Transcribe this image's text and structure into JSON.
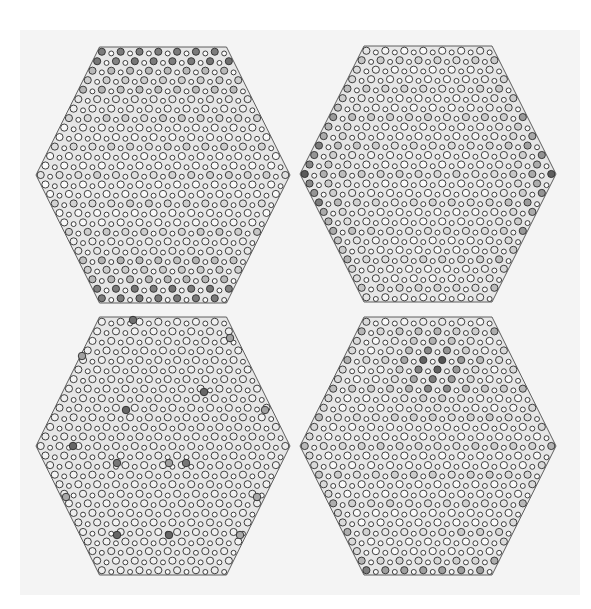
{
  "figure": {
    "background": "#f4f4f4",
    "site_outline": "#2a2a2a",
    "bond_color": "#3a3a3a",
    "white_site": "#fbfbfb",
    "dark_site": "#555555",
    "layout": {
      "rows": 2,
      "cols": 2
    }
  },
  "panels": [
    {
      "id": "top-left",
      "center": [
        163,
        175
      ],
      "half_width": 127,
      "half_height": 128,
      "pattern": "edge-top-bottom",
      "description": "Weight concentrated on top and bottom zigzag edges with faint horizontal stripes"
    },
    {
      "id": "top-right",
      "center": [
        428,
        174
      ],
      "half_width": 128,
      "half_height": 128,
      "pattern": "edge-left-right",
      "description": "Weight concentrated at left and right vertices along the central rows"
    },
    {
      "id": "bottom-left",
      "center": [
        163,
        446
      ],
      "half_width": 127,
      "half_height": 129,
      "pattern": "sparse-defects",
      "description": "Nearly uniform light sites with scattered dark isolated sites",
      "dark_sites": [
        [
          133,
          320,
          0.85
        ],
        [
          230,
          338,
          0.55
        ],
        [
          82,
          356,
          0.55
        ],
        [
          204,
          392,
          0.9
        ],
        [
          126,
          410,
          0.9
        ],
        [
          265,
          410,
          0.55
        ],
        [
          73,
          446,
          0.9
        ],
        [
          117,
          463,
          0.8
        ],
        [
          169,
          463,
          0.55
        ],
        [
          186,
          463,
          0.8
        ],
        [
          66,
          497,
          0.5
        ],
        [
          257,
          497,
          0.5
        ],
        [
          117,
          535,
          0.9
        ],
        [
          169,
          535,
          0.9
        ],
        [
          240,
          535,
          0.5
        ]
      ]
    },
    {
      "id": "bottom-right",
      "center": [
        428,
        446
      ],
      "half_width": 128,
      "half_height": 129,
      "pattern": "top-cluster",
      "description": "Dark cluster near the top centre with diffuse mid-gray stripes and darker bottom edge"
    }
  ]
}
